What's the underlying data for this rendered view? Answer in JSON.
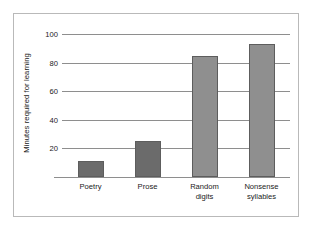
{
  "chart_data": {
    "type": "bar",
    "title": "",
    "xlabel": "",
    "ylabel": "Minutes required for learning",
    "categories": [
      "Poetry",
      "Prose",
      "Random digits",
      "Nonsense syllables"
    ],
    "category_lines": [
      [
        "Poetry"
      ],
      [
        "Prose"
      ],
      [
        "Random",
        "digits"
      ],
      [
        "Nonsense",
        "syllables"
      ]
    ],
    "values": [
      11,
      25,
      85,
      93
    ],
    "ylim": [
      0,
      100
    ],
    "yticks": [
      20,
      40,
      60,
      80,
      100
    ],
    "ytick_labels": [
      "20",
      "40",
      "60",
      "80",
      "100"
    ],
    "grid": true,
    "legend": "none",
    "bar_colors": [
      "#6b6b6b",
      "#6b6b6b",
      "#8f8f8f",
      "#8f8f8f"
    ]
  },
  "style": {
    "frame_color": "#b9b9b9",
    "axis_color": "#8e8e8e",
    "bar_edge_color": "#5d5d5d",
    "text_color": "#1b1b1b",
    "background": "#ffffff"
  }
}
